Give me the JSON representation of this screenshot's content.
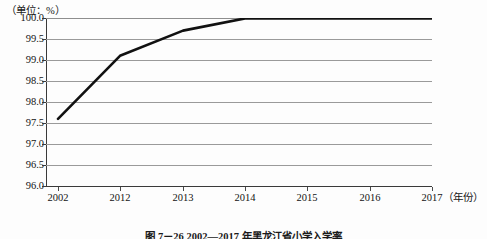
{
  "figure": {
    "unit_label": "（单位：%）",
    "caption": "图 7－26   2002—2017 年黑龙江省小学入学率",
    "x_axis_name": "（年份）"
  },
  "chart_data": {
    "type": "line",
    "title": "",
    "subtitle": "",
    "xlabel": "（年份）",
    "ylabel": "（单位：%）",
    "categories": [
      "2002",
      "2012",
      "2013",
      "2014",
      "2015",
      "2016",
      "2017"
    ],
    "values": [
      97.6,
      99.1,
      99.7,
      99.99,
      99.99,
      99.99,
      99.99
    ],
    "series": [
      {
        "name": "比率",
        "values": [
          97.6,
          99.1,
          99.7,
          99.99,
          99.99,
          99.99,
          99.99
        ]
      }
    ],
    "ylim": [
      96.0,
      100.0
    ],
    "ytick_labels": [
      "100.0",
      "99.5",
      "99.0",
      "98.5",
      "98.0",
      "97.5",
      "97.0",
      "96.5",
      "96.0"
    ],
    "ytick_values": [
      100.0,
      99.5,
      99.0,
      98.5,
      98.0,
      97.5,
      97.0,
      96.5,
      96.0
    ],
    "xtick_labels": [
      "2002",
      "2012",
      "2013",
      "2014",
      "2015",
      "2016",
      "2017"
    ],
    "grid": "horizontal",
    "legend": "none",
    "line_color": "#111111",
    "grid_color": "#9a9a9a",
    "axis_color": "#3a3a3a"
  }
}
